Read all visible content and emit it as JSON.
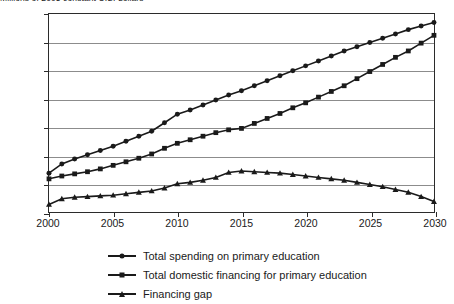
{
  "chart_data": {
    "type": "line",
    "title": "Millions of 2005 constant U.S. dollars",
    "xlabel": "",
    "ylabel": "",
    "xlim": [
      2000,
      2030
    ],
    "ylim": [
      0,
      14000
    ],
    "ytick_labels": [
      "0",
      "2,000",
      "4,000",
      "6,000",
      "8,000",
      "10,000",
      "12,000",
      "14,000"
    ],
    "ytick_values": [
      0,
      2000,
      4000,
      6000,
      8000,
      10000,
      12000,
      14000
    ],
    "xtick_labels": [
      "2000",
      "2005",
      "2010",
      "2015",
      "2020",
      "2025",
      "2030"
    ],
    "xtick_values": [
      2000,
      2005,
      2010,
      2015,
      2020,
      2025,
      2030
    ],
    "grid": true,
    "legend_position": "below",
    "x": [
      2000,
      2001,
      2002,
      2003,
      2004,
      2005,
      2006,
      2007,
      2008,
      2009,
      2010,
      2011,
      2012,
      2013,
      2014,
      2015,
      2016,
      2017,
      2018,
      2019,
      2020,
      2021,
      2022,
      2023,
      2024,
      2025,
      2026,
      2027,
      2028,
      2029,
      2030
    ],
    "series": [
      {
        "name": "Total spending on primary education",
        "marker": "circle",
        "color": "#1a1a1a",
        "values": [
          2800,
          3450,
          3800,
          4100,
          4400,
          4700,
          5050,
          5400,
          5750,
          6350,
          6950,
          7250,
          7600,
          7950,
          8300,
          8600,
          8950,
          9300,
          9650,
          10000,
          10350,
          10700,
          11050,
          11400,
          11700,
          12000,
          12300,
          12600,
          12900,
          13150,
          13400
        ]
      },
      {
        "name": "Total domestic financing for primary education",
        "marker": "square",
        "color": "#1a1a1a",
        "values": [
          2400,
          2600,
          2750,
          2900,
          3100,
          3350,
          3600,
          3850,
          4150,
          4550,
          4900,
          5150,
          5400,
          5650,
          5850,
          5950,
          6300,
          6650,
          7000,
          7400,
          7750,
          8150,
          8550,
          8950,
          9450,
          9950,
          10450,
          10950,
          11400,
          11950,
          12500
        ]
      },
      {
        "name": "Financing gap",
        "marker": "triangle",
        "color": "#1a1a1a",
        "values": [
          600,
          1000,
          1100,
          1150,
          1200,
          1250,
          1350,
          1450,
          1550,
          1750,
          2050,
          2150,
          2300,
          2500,
          2850,
          2950,
          2900,
          2850,
          2800,
          2700,
          2600,
          2500,
          2400,
          2300,
          2150,
          2000,
          1850,
          1650,
          1450,
          1150,
          800
        ]
      }
    ]
  },
  "legend": {
    "items": [
      {
        "label": "Total spending on primary education",
        "marker": "circle"
      },
      {
        "label": "Total domestic financing for primary education",
        "marker": "square"
      },
      {
        "label": "Financing gap",
        "marker": "triangle"
      }
    ]
  }
}
